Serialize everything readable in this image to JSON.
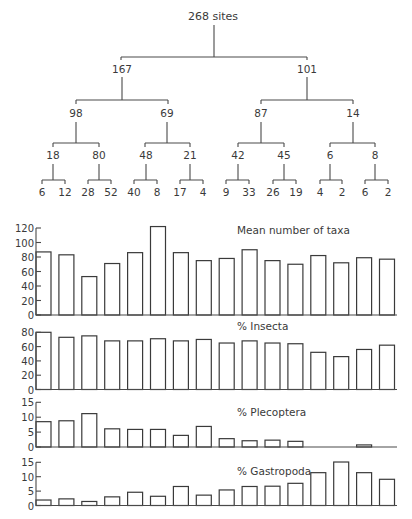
{
  "dendrogram": {
    "root": "268 sites",
    "level1": [
      "167",
      "101"
    ],
    "level2": [
      "98",
      "69",
      "87",
      "14"
    ],
    "level3": [
      "18",
      "80",
      "48",
      "21",
      "42",
      "45",
      "6",
      "8"
    ],
    "leaves": [
      "6",
      "12",
      "28",
      "52",
      "40",
      "8",
      "17",
      "4",
      "9",
      "33",
      "26",
      "19",
      "4",
      "2",
      "6",
      "2"
    ]
  },
  "chart_data": [
    {
      "type": "bar",
      "title": "Mean number of taxa",
      "xlabel": "",
      "ylabel": "",
      "yticks": [
        0,
        20,
        40,
        60,
        80,
        100,
        120
      ],
      "ylim": [
        0,
        120
      ],
      "categories": [
        "6",
        "12",
        "28",
        "52",
        "40",
        "8",
        "17",
        "4",
        "9",
        "33",
        "26",
        "19",
        "4",
        "2",
        "6",
        "2"
      ],
      "values": [
        87,
        83,
        53,
        71,
        86,
        122,
        86,
        75,
        78,
        90,
        75,
        70,
        82,
        72,
        79,
        77
      ]
    },
    {
      "type": "bar",
      "title": "% Insecta",
      "xlabel": "",
      "ylabel": "",
      "yticks": [
        0,
        20,
        40,
        60,
        80
      ],
      "ylim": [
        0,
        80
      ],
      "categories": [
        "6",
        "12",
        "28",
        "52",
        "40",
        "8",
        "17",
        "4",
        "9",
        "33",
        "26",
        "19",
        "4",
        "2",
        "6",
        "2"
      ],
      "values": [
        80,
        73,
        75,
        68,
        68,
        71,
        68,
        70,
        65,
        68,
        65,
        64,
        52,
        46,
        56,
        62
      ]
    },
    {
      "type": "bar",
      "title": "% Plecoptera",
      "xlabel": "",
      "ylabel": "",
      "yticks": [
        0,
        5,
        10,
        15
      ],
      "ylim": [
        0,
        15
      ],
      "categories": [
        "6",
        "12",
        "28",
        "52",
        "40",
        "8",
        "17",
        "4",
        "9",
        "33",
        "26",
        "19",
        "4",
        "2",
        "6",
        "2"
      ],
      "values": [
        8.5,
        8.8,
        11.2,
        6.1,
        5.9,
        5.9,
        3.9,
        6.9,
        2.8,
        2.1,
        2.3,
        1.9,
        0,
        0,
        0.7,
        0
      ]
    },
    {
      "type": "bar",
      "title": "% Gastropoda",
      "xlabel": "",
      "ylabel": "",
      "yticks": [
        0,
        5,
        10,
        15
      ],
      "ylim": [
        0,
        15
      ],
      "categories": [
        "6",
        "12",
        "28",
        "52",
        "40",
        "8",
        "17",
        "4",
        "9",
        "33",
        "26",
        "19",
        "4",
        "2",
        "6",
        "2"
      ],
      "values": [
        1.9,
        2.3,
        1.4,
        3.0,
        4.6,
        3.2,
        6.6,
        3.6,
        5.4,
        6.6,
        6.7,
        7.7,
        11.4,
        15.1,
        11.4,
        9.1
      ]
    }
  ]
}
